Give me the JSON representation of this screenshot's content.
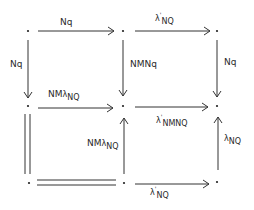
{
  "diagram": {
    "type": "commutative-diagram",
    "nodes": [
      {
        "id": "r0c0",
        "label": "·"
      },
      {
        "id": "r0c1",
        "label": "·"
      },
      {
        "id": "r0c2",
        "label": "·"
      },
      {
        "id": "r1c0",
        "label": "·"
      },
      {
        "id": "r1c1",
        "label": "·"
      },
      {
        "id": "r1c2",
        "label": "·"
      },
      {
        "id": "r2c0",
        "label": "·"
      },
      {
        "id": "r2c1",
        "label": "·"
      },
      {
        "id": "r2c2",
        "label": "·"
      }
    ],
    "edges": {
      "top_left": {
        "from": "r0c0",
        "to": "r0c1",
        "label": "Nq"
      },
      "top_right": {
        "from": "r0c1",
        "to": "r0c2",
        "label_base": "λ",
        "label_sup": "'",
        "label_sub": "NQ"
      },
      "left_upper": {
        "from": "r0c0",
        "to": "r1c0",
        "label": "Nq"
      },
      "mid_upper": {
        "from": "r0c1",
        "to": "r1c1",
        "label": "NMNq"
      },
      "right_upper": {
        "from": "r0c2",
        "to": "r1c2",
        "label": "Nq"
      },
      "mid_left": {
        "from": "r1c0",
        "to": "r1c1",
        "label_prefix": "NM",
        "label_base": "λ",
        "label_sub": "NQ"
      },
      "mid_right": {
        "from": "r1c1",
        "to": "r1c2",
        "label_base": "λ",
        "label_sup": "'",
        "label_sub": "NMNQ"
      },
      "left_lower": {
        "from": "r1c0",
        "to": "r2c0",
        "label": "",
        "style": "double-line"
      },
      "mid_lower": {
        "from": "r2c1",
        "to": "r1c1",
        "label_prefix": "NM",
        "label_base": "λ",
        "label_sub": "NQ"
      },
      "right_lower": {
        "from": "r2c2",
        "to": "r1c2",
        "label_base": "λ",
        "label_sub": "NQ"
      },
      "bottom_left": {
        "from": "r2c0",
        "to": "r2c1",
        "label": "",
        "style": "double-line"
      },
      "bottom_right": {
        "from": "r2c1",
        "to": "r2c2",
        "label_base": "λ",
        "label_sup": "'",
        "label_sub": "NQ"
      }
    }
  }
}
